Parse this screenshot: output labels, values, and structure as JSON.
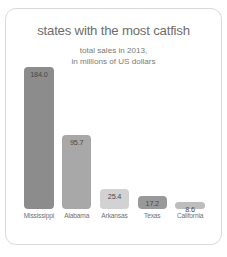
{
  "chart_data": {
    "type": "bar",
    "title": "states with the most catfish",
    "subtitle_line1": "total sales in 2013,",
    "subtitle_line2": "in millions of US dollars",
    "categories": [
      "Mississippi",
      "Alabama",
      "Arkansas",
      "Texas",
      "California"
    ],
    "values": [
      184.0,
      95.7,
      25.4,
      17.2,
      8.6
    ],
    "value_labels": [
      "184.0",
      "95.7",
      "25.4",
      "17.2",
      "8.6"
    ],
    "bar_colors": [
      "#8c8c8c",
      "#a8a8a8",
      "#d2d2d2",
      "#999999",
      "#bdbdbd"
    ],
    "xlabel": "",
    "ylabel": "",
    "ylim": [
      0,
      184.0
    ],
    "grid": false,
    "legend": "none",
    "axis_ticks_visible": false
  },
  "card": {
    "background": "#ffffff",
    "border_color": "#d8d8d8"
  }
}
